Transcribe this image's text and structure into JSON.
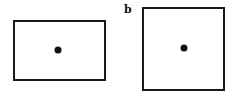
{
  "figure": {
    "panels": [
      {
        "id": "a",
        "label": "",
        "shape": "rectangle",
        "box": {
          "x": 13,
          "y": 20,
          "w": 93,
          "h": 61
        },
        "dot": {
          "x": 58,
          "y": 50
        }
      },
      {
        "id": "b",
        "label": "b",
        "shape": "square",
        "box": {
          "x": 142,
          "y": 7,
          "w": 83,
          "h": 84
        },
        "dot": {
          "x": 184,
          "y": 48
        }
      }
    ],
    "colors": {
      "stroke": "#1a1a1a",
      "dot": "#111111",
      "background": "#ffffff"
    }
  }
}
